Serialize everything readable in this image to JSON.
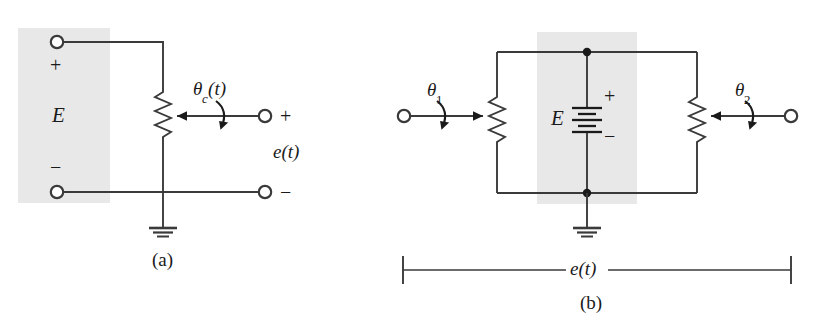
{
  "figure": {
    "width": 818,
    "height": 330,
    "background": "#ffffff",
    "line_color": "#3a3a3a",
    "shade_color": "#e6e6e6",
    "text_color": "#1a1a1a"
  },
  "panel_a": {
    "caption": "(a)",
    "source_label": "E",
    "source_plus": "+",
    "source_minus": "−",
    "shaft_label_theta": "θ",
    "shaft_label_sub": "c",
    "shaft_label_arg": "(t)",
    "output_label": "e(t)",
    "output_plus": "+",
    "output_minus": "−",
    "icons": [
      "terminal-circle-icon",
      "resistor-zigzag-icon",
      "wiper-arrow-icon",
      "rotation-arrow-icon",
      "ground-icon"
    ]
  },
  "panel_b": {
    "caption": "(b)",
    "source_label": "E",
    "source_plus": "+",
    "source_minus": "−",
    "left_shaft_theta": "θ",
    "left_shaft_sub": "1",
    "right_shaft_theta": "θ",
    "right_shaft_sub": "2",
    "output_label": "e(t)",
    "icons": [
      "terminal-circle-icon",
      "resistor-zigzag-icon",
      "wiper-arrow-icon",
      "rotation-arrow-icon",
      "battery-icon",
      "ground-icon",
      "junction-dot-icon",
      "dimension-line-icon"
    ]
  }
}
